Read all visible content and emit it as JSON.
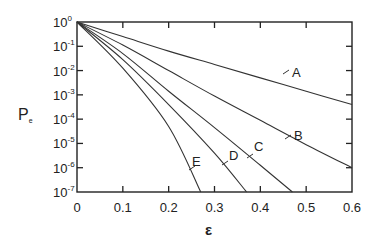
{
  "chart_data": {
    "type": "line",
    "title": "",
    "xlabel": "ε",
    "ylabel": "Pe",
    "yscale": "log",
    "xlim": [
      0,
      0.6
    ],
    "ylim": [
      1e-07,
      1
    ],
    "x_ticks": [
      "0",
      "0.1",
      "0.2",
      "0.3",
      "0.4",
      "0.5",
      "0.6"
    ],
    "y_ticks": [
      "10^0",
      "10^-1",
      "10^-2",
      "10^-3",
      "10^-4",
      "10^-5",
      "10^-6",
      "10^-7"
    ],
    "grid": false,
    "legend": "inline curve labels",
    "series": [
      {
        "name": "A",
        "x": [
          0,
          0.1,
          0.2,
          0.3,
          0.4,
          0.5,
          0.6
        ],
        "log10_y": [
          0,
          -0.6,
          -1.2,
          -1.75,
          -2.3,
          -2.85,
          -3.4
        ]
      },
      {
        "name": "B",
        "x": [
          0,
          0.1,
          0.2,
          0.3,
          0.4,
          0.5,
          0.6
        ],
        "log10_y": [
          0,
          -0.95,
          -2.0,
          -3.05,
          -4.05,
          -5.05,
          -6.0
        ]
      },
      {
        "name": "C",
        "x": [
          0,
          0.1,
          0.2,
          0.3,
          0.4,
          0.47
        ],
        "log10_y": [
          0,
          -1.3,
          -2.85,
          -4.35,
          -5.9,
          -7.0
        ]
      },
      {
        "name": "D",
        "x": [
          0,
          0.1,
          0.2,
          0.3,
          0.37
        ],
        "log10_y": [
          0,
          -1.55,
          -3.4,
          -5.4,
          -7.0
        ]
      },
      {
        "name": "E",
        "x": [
          0,
          0.1,
          0.2,
          0.27
        ],
        "log10_y": [
          0,
          -1.9,
          -4.3,
          -7.0
        ]
      }
    ]
  },
  "labels": {
    "xlabel": "ε",
    "ylabel_main": "P",
    "ylabel_sub": "e",
    "x_ticks": [
      "0",
      "0.1",
      "0.2",
      "0.3",
      "0.4",
      "0.5",
      "0.6"
    ],
    "y_exps": [
      "0",
      "-1",
      "-2",
      "-3",
      "-4",
      "-5",
      "-6",
      "-7"
    ],
    "y_base": "10",
    "curves": [
      "A",
      "B",
      "C",
      "D",
      "E"
    ]
  }
}
